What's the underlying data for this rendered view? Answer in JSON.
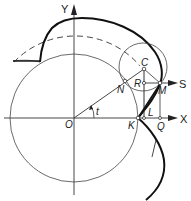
{
  "figure": {
    "axes": {
      "x_label": "X",
      "y_label": "Y",
      "extra_ray_label": "S",
      "angle_label": "t"
    },
    "points": {
      "origin": "O",
      "C": "C",
      "N": "N",
      "R": "R",
      "M": "M",
      "K": "K",
      "L": "L",
      "Q": "Q"
    },
    "elements": [
      "large circle centered at O",
      "small circle centered at C",
      "dashed circle arc",
      "thick spiral curve",
      "radius O to C at angle t"
    ],
    "colors": {
      "stroke": "#111111",
      "background": "#ffffff"
    }
  }
}
